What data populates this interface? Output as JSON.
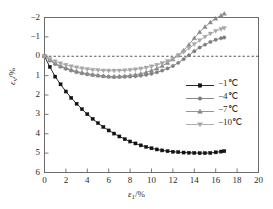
{
  "chart_data": {
    "type": "line",
    "title": "",
    "xlabel": "ε₁/%",
    "ylabel": "εᵥ/%",
    "xlim": [
      0,
      20
    ],
    "ylim": [
      -2,
      6
    ],
    "y_axis_inverted": true,
    "grid": false,
    "zero_reference_line": {
      "value": 0,
      "style": "dashed"
    },
    "xticks": [
      0,
      2,
      4,
      6,
      8,
      10,
      12,
      14,
      16,
      18,
      20
    ],
    "xtick_labels": [
      "0",
      "2",
      "4",
      "6",
      "8",
      "10",
      "12",
      "14",
      "16",
      "18",
      "20"
    ],
    "yticks": [
      -2,
      -1,
      0,
      1,
      2,
      3,
      4,
      5,
      6
    ],
    "ytick_labels": [
      "−2",
      "−1",
      "0",
      "1",
      "2",
      "3",
      "4",
      "5",
      "6"
    ],
    "legend_position": "center-right",
    "series": [
      {
        "name": "−1℃",
        "marker": "square",
        "color": "#111111",
        "x": [
          0,
          0.5,
          1.0,
          1.5,
          2.0,
          2.5,
          3.0,
          3.5,
          4.0,
          4.5,
          5.0,
          5.5,
          6.0,
          6.5,
          7.0,
          7.5,
          8.0,
          8.5,
          9.0,
          9.5,
          10.0,
          10.5,
          11.0,
          11.5,
          12.0,
          12.5,
          13.0,
          13.5,
          14.0,
          14.5,
          15.0,
          15.5,
          16.0,
          16.5,
          16.8
        ],
        "y": [
          0.0,
          0.55,
          1.05,
          1.45,
          1.82,
          2.15,
          2.45,
          2.73,
          2.99,
          3.23,
          3.45,
          3.65,
          3.83,
          3.99,
          4.14,
          4.28,
          4.4,
          4.5,
          4.6,
          4.68,
          4.75,
          4.81,
          4.86,
          4.9,
          4.93,
          4.95,
          4.97,
          4.98,
          4.99,
          5.0,
          5.0,
          4.99,
          4.96,
          4.92,
          4.9
        ]
      },
      {
        "name": "−4℃",
        "marker": "circle",
        "color": "#7d7d7d",
        "x": [
          0,
          0.5,
          1.0,
          1.5,
          2.0,
          2.5,
          3.0,
          3.5,
          4.0,
          4.5,
          5.0,
          5.5,
          6.0,
          6.5,
          7.0,
          7.5,
          8.0,
          8.5,
          9.0,
          9.5,
          10.0,
          10.5,
          11.0,
          11.5,
          12.0,
          12.5,
          13.0,
          13.5,
          14.0,
          14.5,
          15.0,
          15.5,
          16.0,
          16.5,
          16.8
        ],
        "y": [
          0.0,
          0.22,
          0.4,
          0.54,
          0.65,
          0.74,
          0.82,
          0.88,
          0.93,
          0.97,
          1.0,
          1.03,
          1.06,
          1.07,
          1.07,
          1.06,
          1.05,
          1.03,
          1.0,
          0.96,
          0.9,
          0.83,
          0.74,
          0.63,
          0.5,
          0.34,
          0.15,
          -0.05,
          -0.26,
          -0.45,
          -0.6,
          -0.74,
          -0.85,
          -0.93,
          -0.97
        ]
      },
      {
        "name": "−7℃",
        "marker": "triangle-up",
        "color": "#8a8a8a",
        "x": [
          0,
          0.5,
          1.0,
          1.5,
          2.0,
          2.5,
          3.0,
          3.5,
          4.0,
          4.5,
          5.0,
          5.5,
          6.0,
          6.5,
          7.0,
          7.5,
          8.0,
          8.5,
          9.0,
          9.5,
          10.0,
          10.5,
          11.0,
          11.5,
          12.0,
          12.5,
          13.0,
          13.5,
          14.0,
          14.5,
          15.0,
          15.5,
          16.0,
          16.5,
          16.8
        ],
        "y": [
          0.0,
          0.2,
          0.37,
          0.5,
          0.6,
          0.7,
          0.78,
          0.85,
          0.9,
          0.95,
          0.99,
          1.02,
          1.04,
          1.05,
          1.04,
          1.02,
          0.99,
          0.95,
          0.9,
          0.83,
          0.74,
          0.63,
          0.5,
          0.34,
          0.16,
          -0.05,
          -0.3,
          -0.6,
          -0.94,
          -1.25,
          -1.52,
          -1.75,
          -1.95,
          -2.1,
          -2.2
        ]
      },
      {
        "name": "−10℃",
        "marker": "triangle-down",
        "color": "#a6a6a6",
        "x": [
          0,
          0.5,
          1.0,
          1.5,
          2.0,
          2.5,
          3.0,
          3.5,
          4.0,
          4.5,
          5.0,
          5.5,
          6.0,
          6.5,
          7.0,
          7.5,
          8.0,
          8.5,
          9.0,
          9.5,
          10.0,
          10.5,
          11.0,
          11.5,
          12.0,
          12.5,
          13.0,
          13.5,
          14.0,
          14.5,
          15.0,
          15.5,
          16.0,
          16.5,
          16.8
        ],
        "y": [
          0.0,
          0.15,
          0.27,
          0.37,
          0.45,
          0.52,
          0.58,
          0.63,
          0.67,
          0.7,
          0.72,
          0.74,
          0.75,
          0.75,
          0.74,
          0.73,
          0.71,
          0.68,
          0.64,
          0.59,
          0.53,
          0.45,
          0.36,
          0.25,
          0.12,
          -0.04,
          -0.22,
          -0.42,
          -0.62,
          -0.82,
          -1.0,
          -1.16,
          -1.3,
          -1.4,
          -1.45
        ]
      }
    ]
  },
  "legend": {
    "items": [
      {
        "label": "−1",
        "unit": "℃",
        "marker": "square"
      },
      {
        "label": "−4",
        "unit": "℃",
        "marker": "circle"
      },
      {
        "label": "−7",
        "unit": "℃",
        "marker": "triangle-up"
      },
      {
        "label": "−10",
        "unit": "℃",
        "marker": "triangle-down"
      }
    ]
  },
  "axis_labels": {
    "x": "ε₁/%",
    "y": "εᵥ/%"
  }
}
